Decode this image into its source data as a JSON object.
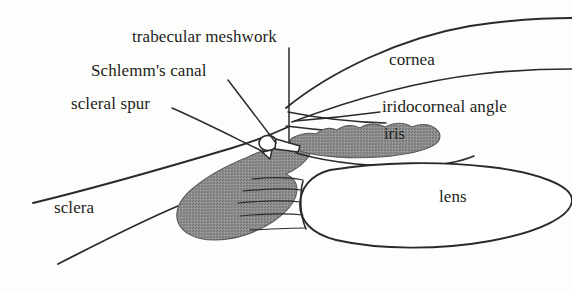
{
  "figure": {
    "kind": "anatomical-line-drawing",
    "width": 572,
    "height": 292,
    "background_color": "#fdfdfc",
    "ink_color": "#1d1d1b",
    "shaded_tissue_color": "#8a8a8a"
  },
  "labels": {
    "trabecular_meshwork": "trabecular meshwork",
    "schlemms_canal": "Schlemm's canal",
    "scleral_spur": "scleral spur",
    "iridocorneal_angle": "iridocorneal angle",
    "cornea": "cornea",
    "iris": "iris",
    "lens": "lens",
    "sclera": "sclera"
  },
  "structures": [
    {
      "name": "cornea",
      "shading": "none",
      "has_leader_line": false
    },
    {
      "name": "sclera",
      "shading": "none",
      "has_leader_line": false
    },
    {
      "name": "lens",
      "shading": "none",
      "has_leader_line": false
    },
    {
      "name": "iris",
      "shading": "gray",
      "has_leader_line": false
    },
    {
      "name": "ciliary-body",
      "shading": "gray",
      "has_leader_line": false
    },
    {
      "name": "trabecular-meshwork",
      "shading": "none",
      "has_leader_line": true
    },
    {
      "name": "schlemms-canal",
      "shading": "none",
      "has_leader_line": true
    },
    {
      "name": "scleral-spur",
      "shading": "none",
      "has_leader_line": true
    },
    {
      "name": "iridocorneal-angle",
      "shading": "none",
      "has_leader_line": true
    }
  ]
}
